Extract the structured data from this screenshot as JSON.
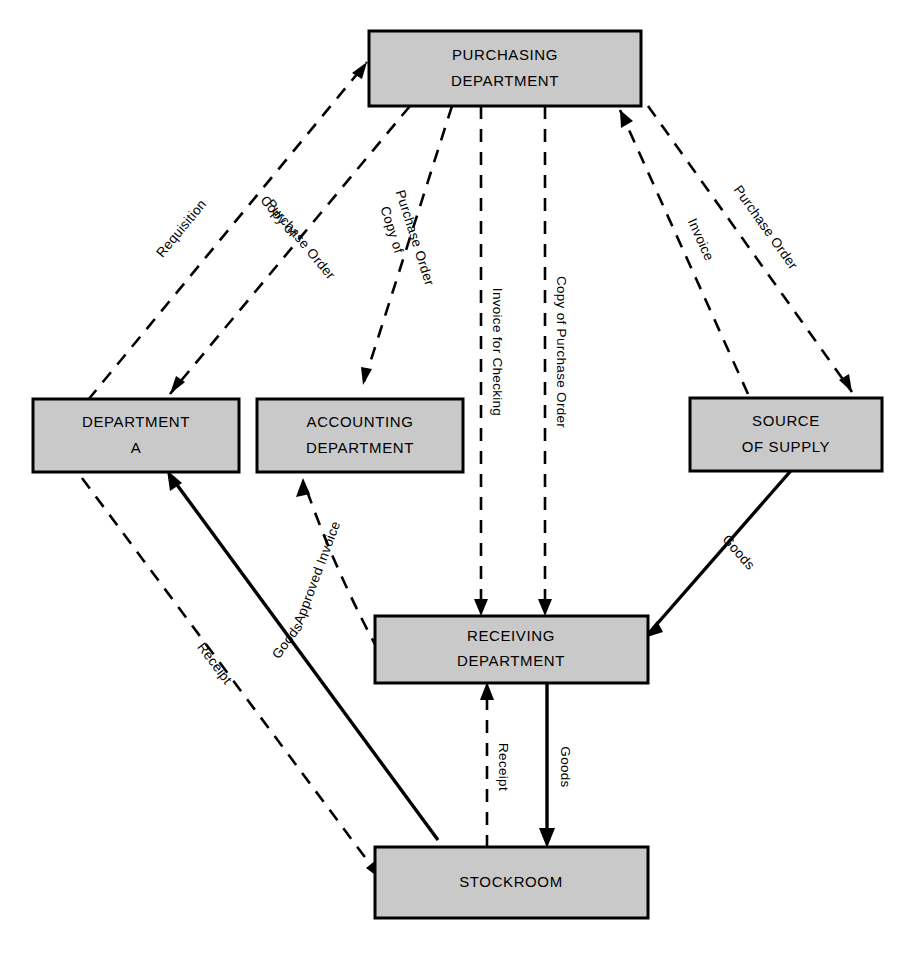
{
  "diagram": {
    "background_color": "#ffffff",
    "node_fill_color": "#c9c9c9",
    "node_border_color": "#000000",
    "line_color": "#000000",
    "nodes": [
      {
        "id": "purchasing",
        "line1": "PURCHASING",
        "line2": "DEPARTMENT"
      },
      {
        "id": "department_a",
        "line1": "DEPARTMENT",
        "line2": "A"
      },
      {
        "id": "accounting",
        "line1": "ACCOUNTING",
        "line2": "DEPARTMENT"
      },
      {
        "id": "source",
        "line1": "SOURCE",
        "line2": "OF SUPPLY"
      },
      {
        "id": "receiving",
        "line1": "RECEIVING",
        "line2": "DEPARTMENT"
      },
      {
        "id": "stockroom",
        "line1": "STOCKROOM",
        "line2": ""
      }
    ],
    "edges": [
      {
        "id": "e-requisition",
        "label": "Requisition",
        "from": "department_a",
        "to": "purchasing",
        "style": "dashed"
      },
      {
        "id": "e-copy-po-dept-a-1",
        "label": "Copy of",
        "label2": "Purchase Order",
        "from": "purchasing",
        "to": "department_a",
        "style": "dashed"
      },
      {
        "id": "e-copy-po-accounting-1",
        "label": "Copy of",
        "label2": "Purchase Order",
        "from": "purchasing",
        "to": "accounting",
        "style": "dashed"
      },
      {
        "id": "e-invoice-checking",
        "label": "Invoice for Checking",
        "from": "purchasing",
        "to": "receiving",
        "style": "dashed"
      },
      {
        "id": "e-copy-po-receiving",
        "label": "Copy of Purchase Order",
        "from": "purchasing",
        "to": "receiving",
        "style": "dashed"
      },
      {
        "id": "e-invoice",
        "label": "Invoice",
        "from": "source",
        "to": "purchasing",
        "style": "dashed"
      },
      {
        "id": "e-purchase-order",
        "label": "Purchase Order",
        "from": "purchasing",
        "to": "source",
        "style": "dashed"
      },
      {
        "id": "e-goods-source",
        "label": "Goods",
        "from": "source",
        "to": "receiving",
        "style": "solid"
      },
      {
        "id": "e-approved-invoice",
        "label": "Approved Invoice",
        "from": "receiving",
        "to": "accounting",
        "style": "dashed"
      },
      {
        "id": "e-goods-stockroom",
        "label": "Goods",
        "from": "receiving",
        "to": "stockroom",
        "style": "solid"
      },
      {
        "id": "e-receipt-receiving",
        "label": "Receipt",
        "from": "stockroom",
        "to": "receiving",
        "style": "dashed"
      },
      {
        "id": "e-goods-dept-a",
        "label": "Goods",
        "from": "stockroom",
        "to": "department_a",
        "style": "solid"
      },
      {
        "id": "e-receipt-dept-a",
        "label": "Receipt",
        "from": "department_a",
        "to": "stockroom",
        "style": "dashed"
      }
    ]
  }
}
